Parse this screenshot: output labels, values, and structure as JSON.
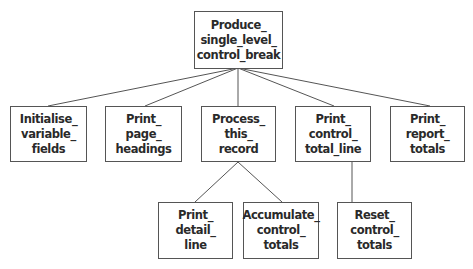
{
  "diagram": {
    "type": "structure-chart",
    "line_color": "#555555",
    "box_border_color": "#555555",
    "text_color": "#2a2a2a",
    "root": {
      "id": "produce",
      "lines": [
        "Produce_",
        "single_level_",
        "control_break"
      ]
    },
    "level1": [
      {
        "id": "initialise",
        "lines": [
          "Initialise_",
          "variable_",
          "fields"
        ]
      },
      {
        "id": "print-headings",
        "lines": [
          "Print_",
          "page_",
          "headings"
        ]
      },
      {
        "id": "process-record",
        "lines": [
          "Process_",
          "this_",
          "record"
        ]
      },
      {
        "id": "print-control-total",
        "lines": [
          "Print_",
          "control_",
          "total_line"
        ]
      },
      {
        "id": "print-report-totals",
        "lines": [
          "Print_",
          "report_",
          "totals"
        ]
      }
    ],
    "level2": [
      {
        "id": "print-detail",
        "parent": "process-record",
        "lines": [
          "Print_",
          "detail_",
          "line"
        ]
      },
      {
        "id": "accumulate",
        "parent": "process-record",
        "lines": [
          "Accumulate_",
          "control_",
          "totals"
        ]
      },
      {
        "id": "reset",
        "parent": "print-control-total",
        "lines": [
          "Reset_",
          "control_",
          "totals"
        ]
      }
    ]
  }
}
